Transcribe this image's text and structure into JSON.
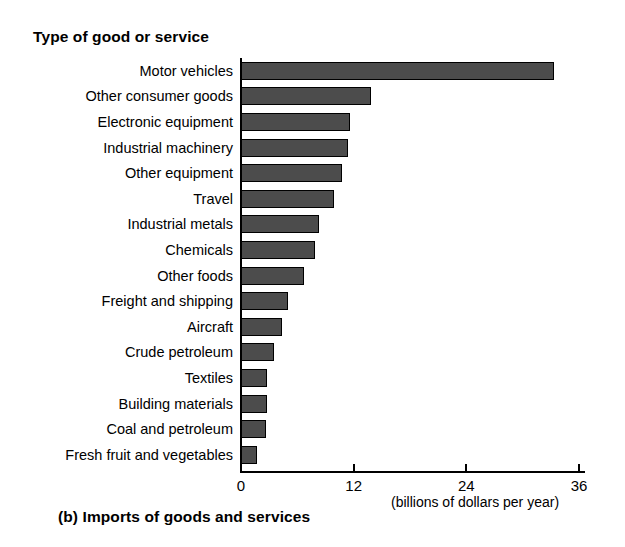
{
  "chart_data": {
    "type": "bar",
    "orientation": "horizontal",
    "title": "Type of good or service",
    "caption": "(b) Imports of goods and services",
    "xlabel": "(billions of dollars per year)",
    "ylabel": "Type of good or service",
    "xlim": [
      0,
      38
    ],
    "xticks": [
      0,
      12,
      24,
      36
    ],
    "xtick_labels": [
      "0",
      "12",
      "24",
      "36"
    ],
    "grid": false,
    "legend": null,
    "bar_color": "#4c4c4c",
    "bar_edge_color": "#000000",
    "categories": [
      "Motor vehicles",
      "Other consumer goods",
      "Electronic equipment",
      "Industrial machinery",
      "Other equipment",
      "Travel",
      "Industrial metals",
      "Chemicals",
      "Other foods",
      "Freight and shipping",
      "Aircraft",
      "Crude petroleum",
      "Textiles",
      "Building materials",
      "Coal and petroleum",
      "Fresh fruit and vegetables"
    ],
    "values": [
      33.3,
      13.8,
      11.6,
      11.4,
      10.8,
      9.9,
      8.3,
      7.9,
      6.7,
      5.0,
      4.4,
      3.5,
      2.8,
      2.8,
      2.7,
      1.7
    ]
  }
}
